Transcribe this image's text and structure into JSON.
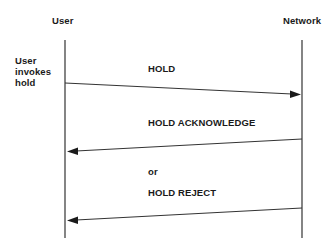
{
  "diagram": {
    "type": "sequence",
    "participants": [
      {
        "id": "user",
        "label": "User"
      },
      {
        "id": "network",
        "label": "Network"
      }
    ],
    "side_note": {
      "lines": [
        "User",
        "invokes",
        "hold"
      ]
    },
    "messages": [
      {
        "label": "HOLD",
        "from": "user",
        "to": "network"
      },
      {
        "label": "HOLD ACKNOWLEDGE",
        "from": "network",
        "to": "user"
      },
      {
        "separator": "or"
      },
      {
        "label": "HOLD REJECT",
        "from": "network",
        "to": "user"
      }
    ],
    "colors": {
      "line": "#333333",
      "text": "#1a1a1a",
      "background": "#ffffff"
    }
  }
}
